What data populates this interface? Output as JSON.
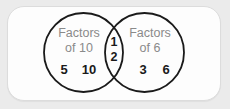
{
  "figure": {
    "type": "venn-diagram",
    "sets": 2,
    "background_color": "#ebebeb",
    "card_color": "#fdfdfd",
    "card_border_color": "#dcdcdc",
    "circle_stroke_color": "#1a1a1a",
    "label_color": "#8a8a8a",
    "member_color": "#1a1a1a"
  },
  "left_set": {
    "title_line1": "Factors",
    "title_line2": "of 10",
    "members": [
      "5",
      "10"
    ]
  },
  "right_set": {
    "title_line1": "Factors",
    "title_line2": "of 6",
    "members": [
      "3",
      "6"
    ]
  },
  "intersection": {
    "members": [
      "1",
      "2"
    ]
  }
}
